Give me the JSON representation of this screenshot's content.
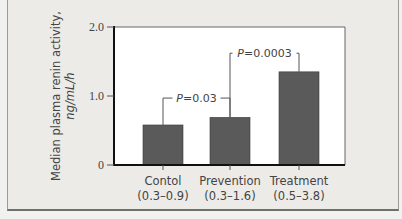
{
  "chart_data": {
    "type": "bar",
    "title": "",
    "xlabel": "",
    "ylabel": "Median plasma renin activity,",
    "ylabel_units": "ng/mL/h",
    "ylim": [
      0,
      2.0
    ],
    "yticks": [
      0,
      1.0,
      2.0
    ],
    "ytick_labels": [
      "0",
      "1.0",
      "2.0"
    ],
    "grid": false,
    "categories": [
      "Contol",
      "Prevention",
      "Treatment"
    ],
    "category_ranges": [
      "(0.3–0.9)",
      "(0.3–1.6)",
      "(0.5–3.8)"
    ],
    "values": [
      0.58,
      0.69,
      1.35
    ],
    "bar_color": "#5a5a5a",
    "annotations": [
      {
        "label_prefix": "P",
        "label_value": "=0.03",
        "from": 0,
        "to": 1
      },
      {
        "label_prefix": "P",
        "label_value": "=0.0003",
        "from": 1,
        "to": 2
      }
    ]
  }
}
